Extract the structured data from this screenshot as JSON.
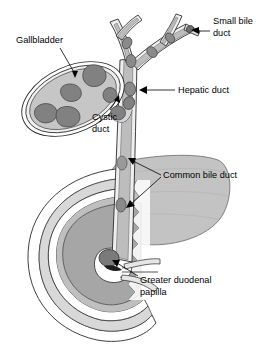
{
  "figure": {
    "type": "anatomical-illustration",
    "background_color": "#ffffff",
    "palette": {
      "outline": "#2b2b2b",
      "duct_lumen": "#bdbdbd",
      "duct_wall": "#efefef",
      "gallbladder_fill": "#c6c6c6",
      "gallbladder_wall": "#eeeeee",
      "stone_fill": "#818181",
      "stone_outline": "#4a4a4a",
      "pancreas_fill": "#c3c3c3",
      "duodenum_wall": "#d8d8d8",
      "duodenum_mucosa": "#a6a6a6",
      "label_text": "#000000",
      "leader_line": "#000000"
    }
  },
  "labels": [
    {
      "id": "gallbladder",
      "text": "Gallbladder",
      "text_x": 16,
      "text_y": 41,
      "anchor": "start",
      "lines": [
        [
          60,
          48,
          75,
          76
        ]
      ]
    },
    {
      "id": "small-bile-duct",
      "text_line1": "Small bile",
      "text_line2": "duct",
      "text_x": 213,
      "text_y": 27,
      "anchor": "start",
      "lines": [
        [
          210,
          33,
          190,
          33
        ]
      ]
    },
    {
      "id": "hepatic-duct",
      "text": "Hepatic duct",
      "text_x": 178,
      "text_y": 91,
      "anchor": "start",
      "lines": [
        [
          175,
          91,
          143,
          91
        ]
      ]
    },
    {
      "id": "cystic-duct",
      "text_line1": "Cystic",
      "text_line2": "duct",
      "text_x": 92,
      "text_y": 118,
      "anchor": "start",
      "lines": [
        [
          110,
          112,
          118,
          97
        ]
      ]
    },
    {
      "id": "common-bile-duct",
      "text": "Common bile duct",
      "text_x": 163,
      "text_y": 176,
      "anchor": "start",
      "lines": [
        [
          161,
          176,
          134,
          159
        ],
        [
          161,
          176,
          136,
          205
        ]
      ]
    },
    {
      "id": "greater-duodenal-papilla",
      "text_line1": "Greater duodenal",
      "text_line2": "papilla",
      "text_x": 140,
      "text_y": 281,
      "anchor": "start",
      "lines": [
        [
          138,
          277,
          113,
          265
        ]
      ]
    }
  ],
  "structures": {
    "gallbladder": {
      "name": "Gallbladder",
      "stone_count": 4
    },
    "cystic_duct": {
      "name": "Cystic duct",
      "stone_count": 3
    },
    "hepatic_duct": {
      "name": "Hepatic duct",
      "stone_count": 2
    },
    "small_bile_ducts": {
      "name": "Small bile duct",
      "stone_count": 3
    },
    "common_bile_duct": {
      "name": "Common bile duct",
      "stone_count": 2
    },
    "duodenal_papilla": {
      "name": "Greater duodenal papilla",
      "stone_count": 1
    },
    "pancreas": {
      "name": "Pancreas"
    },
    "duodenum": {
      "name": "Duodenum"
    }
  }
}
